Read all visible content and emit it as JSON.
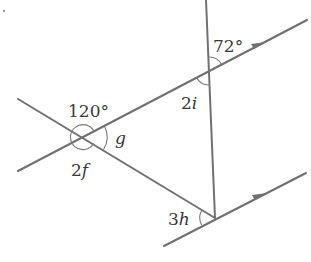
{
  "diagram": {
    "type": "angles-parallel-lines",
    "line_color": "#707070",
    "labels": {
      "angle_72": "72°",
      "angle_120": "120°",
      "angle_g": "g",
      "angle_2f_num": "2",
      "angle_2f_var": "f",
      "angle_2i_num": "2",
      "angle_2i_var": "i",
      "angle_3h_num": "3",
      "angle_3h_var": "h"
    },
    "parallel_marker": "arrow"
  }
}
